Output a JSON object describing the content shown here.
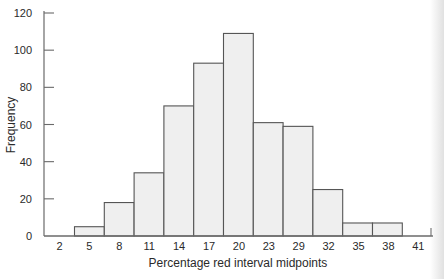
{
  "chart_data": {
    "type": "bar",
    "subtype": "histogram",
    "title": "",
    "xlabel": "Percentage red interval midpoints",
    "ylabel": "Frequency",
    "categories": [
      "5",
      "8",
      "11",
      "14",
      "17",
      "20",
      "23",
      "29",
      "32",
      "35",
      "38"
    ],
    "x_tick_labels": [
      "2",
      "5",
      "8",
      "11",
      "14",
      "17",
      "20",
      "23",
      "29",
      "32",
      "35",
      "38",
      "41"
    ],
    "values": [
      5,
      18,
      34,
      70,
      93,
      109,
      61,
      59,
      25,
      7,
      7
    ],
    "y_ticks": [
      0,
      20,
      40,
      60,
      80,
      100,
      120
    ],
    "ylim": [
      0,
      120
    ],
    "grid": false,
    "legend": null,
    "colors": {
      "bar_fill": "#efefef",
      "bar_edge": "#555555",
      "axis": "#6a6a6a"
    }
  }
}
